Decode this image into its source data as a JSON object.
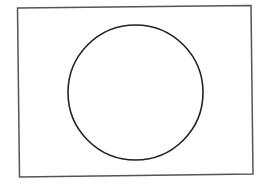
{
  "diagram": {
    "background": "#ffffff",
    "frame": {
      "shape": "rectangle",
      "points": [
        [
          17.5,
          8
        ],
        [
          251,
          5.5
        ],
        [
          253,
          174
        ],
        [
          19.5,
          177
        ]
      ],
      "stroke": "#555555",
      "stroke_width": 1.5
    },
    "circle": {
      "shape": "circle",
      "cx": 135.5,
      "cy": 92.5,
      "r": 67.5,
      "stroke": "#222222",
      "stroke_width": 1.6
    }
  }
}
